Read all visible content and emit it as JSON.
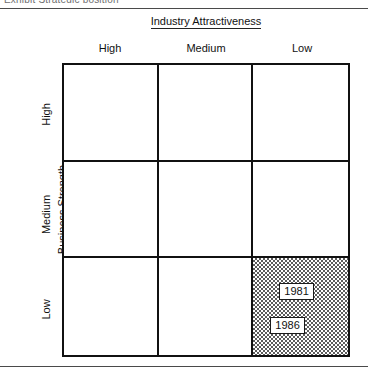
{
  "figure": {
    "clipped_header_text": "Exhibit  Strategic position",
    "column_axis_title": "Industry Attractiveness",
    "row_axis_title": "Business Strength",
    "column_headers": [
      "High",
      "Medium",
      "Low"
    ],
    "row_headers": [
      "High",
      "Medium",
      "Low"
    ],
    "shaded_cell": {
      "row": "Low",
      "column": "Low",
      "fill": "#5c5c5c",
      "pattern": "50-percent-dither"
    },
    "markers": [
      {
        "label": "1981",
        "row": "Low",
        "column": "Low"
      },
      {
        "label": "1986",
        "row": "Low",
        "column": "Low"
      }
    ],
    "colors": {
      "line": "#111111",
      "rule": "#4a4a4a",
      "background": "#ffffff",
      "shading": "#5c5c5c"
    }
  },
  "chart_data": {
    "type": "heatmap",
    "title": "Industry Attractiveness",
    "xlabel": "Industry Attractiveness",
    "ylabel": "Business Strength",
    "x_categories": [
      "High",
      "Medium",
      "Low"
    ],
    "y_categories": [
      "High",
      "Medium",
      "Low"
    ],
    "grid": true,
    "legend": "none",
    "values": [
      [
        0,
        0,
        0
      ],
      [
        0,
        0,
        0
      ],
      [
        0,
        0,
        1
      ]
    ],
    "annotations": [
      {
        "text": "1981",
        "x": "Low",
        "y": "Low"
      },
      {
        "text": "1986",
        "x": "Low",
        "y": "Low"
      }
    ]
  }
}
